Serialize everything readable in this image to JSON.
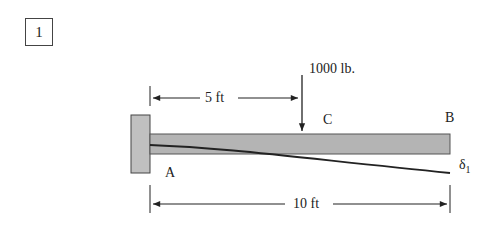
{
  "problem": {
    "number": "1"
  },
  "diagram": {
    "type": "cantilever beam with point load",
    "load": {
      "label": "1000 lb.",
      "position_label": "C"
    },
    "dimensions": {
      "to_load": "5 ft",
      "total_length": "10 ft"
    },
    "points": {
      "fixed_end": "A",
      "free_end": "B",
      "load_point": "C"
    },
    "deflection": {
      "symbol": "δ",
      "subscript": "1"
    },
    "colors": {
      "beam_fill": "#b4b4b4",
      "wall_fill": "#c0c0c0",
      "line": "#222222"
    }
  }
}
